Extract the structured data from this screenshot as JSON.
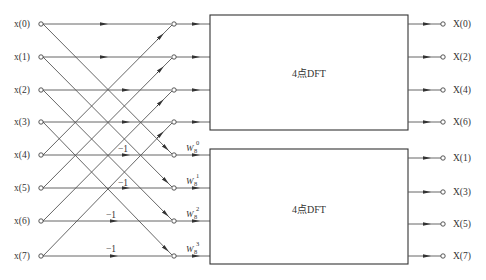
{
  "diagram": {
    "inputs": [
      "x(0)",
      "x(1)",
      "x(2)",
      "x(3)",
      "x(4)",
      "x(5)",
      "x(6)",
      "x(7)"
    ],
    "outputs_top": [
      "X(0)",
      "X(2)",
      "X(4)",
      "X(6)"
    ],
    "outputs_bottom": [
      "X(1)",
      "X(3)",
      "X(5)",
      "X(7)"
    ],
    "top_box_label": "4点DFT",
    "bottom_box_label": "4点DFT",
    "minus_one_labels": [
      "−1",
      "−1",
      "−1",
      "−1"
    ],
    "twiddles": [
      {
        "base": "W",
        "sub": "8",
        "exp": "0"
      },
      {
        "base": "W",
        "sub": "8",
        "exp": "1"
      },
      {
        "base": "W",
        "sub": "8",
        "exp": "2"
      },
      {
        "base": "W",
        "sub": "8",
        "exp": "3"
      }
    ],
    "colors": {
      "line": "#555555",
      "text": "#333333",
      "background": "#ffffff"
    }
  }
}
